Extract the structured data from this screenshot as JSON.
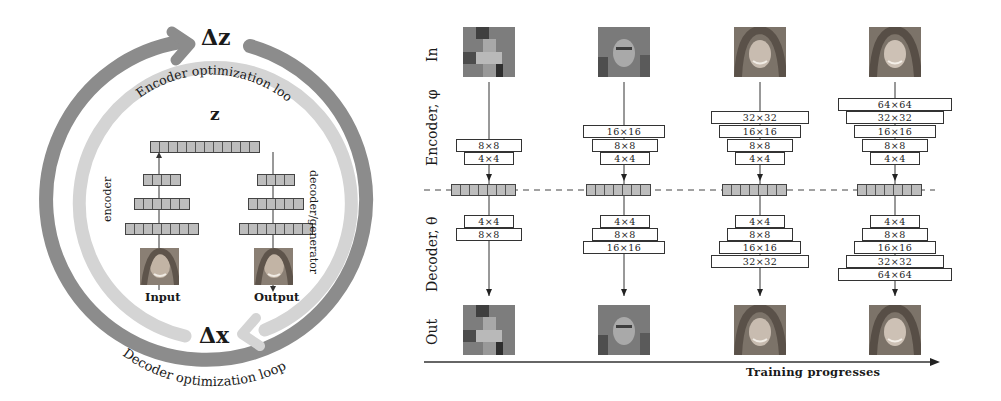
{
  "left_panel": {
    "delta_z": "Δz",
    "delta_x": "Δx",
    "z_label": "z",
    "encoder_loop_label": "Encoder optimization loop",
    "decoder_loop_label": "Decoder optimization loop",
    "encoder_label": "encoder",
    "decoder_label": "decoder/generator",
    "input_label": "Input",
    "output_label": "Output",
    "colors": {
      "outer_arrow": "#8c8c8c",
      "inner_arrow": "#d4d4d4"
    },
    "encoder_layers_cells": [
      8,
      6,
      4
    ],
    "decoder_layers_cells": [
      4,
      6,
      8
    ],
    "latent_cells": 12
  },
  "right_panel": {
    "row_labels": {
      "in": "In",
      "encoder": "Encoder, φ",
      "decoder": "Decoder, θ",
      "out": "Out"
    },
    "axis_label": "Training progresses",
    "latent_cells": 7,
    "columns": [
      {
        "stage": 1,
        "encoder_layers": [
          "8×8",
          "4×4"
        ],
        "decoder_layers": [
          "4×4",
          "8×8"
        ]
      },
      {
        "stage": 2,
        "encoder_layers": [
          "16×16",
          "8×8",
          "4×4"
        ],
        "decoder_layers": [
          "4×4",
          "8×8",
          "16×16"
        ]
      },
      {
        "stage": 3,
        "encoder_layers": [
          "32×32",
          "16×16",
          "8×8",
          "4×4"
        ],
        "decoder_layers": [
          "4×4",
          "8×8",
          "16×16",
          "32×32"
        ]
      },
      {
        "stage": 4,
        "encoder_layers": [
          "64×64",
          "32×32",
          "16×16",
          "8×8",
          "4×4"
        ],
        "decoder_layers": [
          "4×4",
          "8×8",
          "16×16",
          "32×32",
          "64×64"
        ]
      }
    ]
  }
}
